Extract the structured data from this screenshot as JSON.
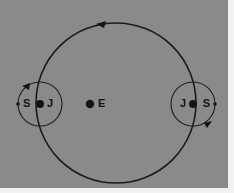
{
  "figure": {
    "background_color": "#8a8a8a",
    "plate_border_color": "#f2f2f2",
    "stroke_color": "#1c1c1c",
    "width": 234,
    "height": 193
  },
  "bodies": {
    "earth": {
      "label": "E",
      "cx": 90,
      "cy": 104,
      "r": 4.2
    },
    "jupiter_left": {
      "label": "J",
      "cx": 40,
      "cy": 104,
      "r": 4.0
    },
    "jupiter_right": {
      "label": "J",
      "cx": 193,
      "cy": 104,
      "r": 4.0
    },
    "satellite_left": {
      "label": "S",
      "cx": 18,
      "cy": 104,
      "r": 1.8
    },
    "satellite_right": {
      "label": "S",
      "cx": 215,
      "cy": 104,
      "r": 1.8
    }
  },
  "orbits": {
    "deferent": {
      "name": "deferent",
      "cx": 116,
      "cy": 103,
      "r": 80,
      "stroke_width": 1.6,
      "direction": "counterclockwise"
    },
    "epicycle_left": {
      "name": "epicycle-left",
      "cx": 40,
      "cy": 104,
      "r": 22,
      "stroke_width": 1.1,
      "direction": "counterclockwise"
    },
    "epicycle_right": {
      "name": "epicycle-right",
      "cx": 193,
      "cy": 104,
      "r": 22,
      "stroke_width": 1.1,
      "direction": "clockwise"
    }
  },
  "arrows": {
    "deferent_arrow": {
      "points": "96,24 106,21 104,28",
      "description": "counterclockwise direction marker on deferent"
    },
    "epicycle_left_arrow": {
      "points": "22,86 30,83 29,90",
      "description": "direction marker on left epicycle"
    },
    "epicycle_right_arrow": {
      "points": "204,123 212,121 207,128",
      "description": "direction marker on right epicycle"
    }
  },
  "labels": {
    "earth": "E",
    "jupiter_left": "J",
    "jupiter_right": "J",
    "satellite_left": "S",
    "satellite_right": "S"
  }
}
